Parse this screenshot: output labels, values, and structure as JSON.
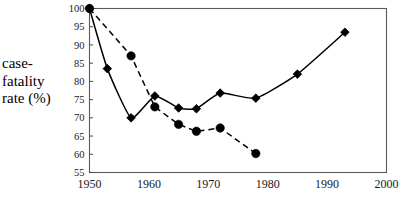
{
  "chart_data": {
    "type": "line",
    "title": "",
    "xlabel": "",
    "ylabel": "case-fatality rate (%)",
    "ylabel_lines": [
      "case-",
      "fatality",
      "rate (%)"
    ],
    "xlim": [
      1950,
      2000
    ],
    "ylim": [
      55,
      100
    ],
    "xticks": [
      1950,
      1960,
      1970,
      1980,
      1990,
      2000
    ],
    "xtick_labels": [
      "1950",
      "1960",
      "1970",
      "1980",
      "1990",
      "2000"
    ],
    "yticks": [
      55,
      60,
      65,
      70,
      75,
      80,
      85,
      90,
      95,
      100
    ],
    "ytick_labels": [
      "55",
      "60",
      "65",
      "70",
      "75",
      "80",
      "85",
      "90",
      "95",
      "100"
    ],
    "grid": false,
    "legend": false,
    "legend_position": "none",
    "line_color": "#000000",
    "marker_color": "#000000",
    "frame_color": "#5a5a5a",
    "series": [
      {
        "name": "solid-diamond-series",
        "linestyle": "solid",
        "marker": "diamond",
        "x": [
          1950,
          1953,
          1957,
          1961,
          1965,
          1968,
          1972,
          1978,
          1985,
          1993
        ],
        "values": [
          100,
          83.5,
          70,
          76,
          72.7,
          72.5,
          76.8,
          75.4,
          82,
          93.5
        ]
      },
      {
        "name": "dashed-circle-series",
        "linestyle": "dashed",
        "marker": "circle",
        "x": [
          1950,
          1957,
          1961,
          1965,
          1968,
          1972,
          1978
        ],
        "values": [
          100,
          87,
          73,
          68.2,
          66.3,
          67.2,
          60.2
        ]
      }
    ]
  }
}
